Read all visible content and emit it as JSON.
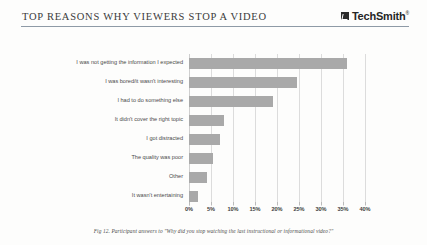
{
  "header": {
    "title": "TOP REASONS WHY VIEWERS STOP A VIDEO",
    "brand_name": "TechSmith",
    "brand_tm": "®",
    "brand_mark_icon": "techsmith-logo-icon"
  },
  "caption": "Fig 12. Participant answers to \"Why did you stop watching the last instructional or informational video?\"",
  "colors": {
    "bar": "#a9a9a9",
    "grid": "#dcdcdc",
    "rule": "#8e9aa6",
    "text": "#4a4a4a",
    "background": "#fdfdfc"
  },
  "chart_data": {
    "type": "bar",
    "orientation": "horizontal",
    "title": "TOP REASONS WHY VIEWERS STOP A VIDEO",
    "xlabel": "",
    "ylabel": "",
    "xlim": [
      0,
      40
    ],
    "grid": true,
    "legend": false,
    "tick_labels": [
      "0%",
      "5%",
      "10%",
      "15%",
      "20%",
      "25%",
      "30%",
      "35%",
      "40%"
    ],
    "tick_values": [
      0,
      5,
      10,
      15,
      20,
      25,
      30,
      35,
      40
    ],
    "categories": [
      "I was not getting the information I expected",
      "I was bored/it wasn't interesting",
      "I had to do something else",
      "It didn't cover the right topic",
      "I got distracted",
      "The quality was poor",
      "Other",
      "It wasn't entertaining"
    ],
    "values": [
      36,
      24.5,
      19,
      8,
      7,
      5.5,
      4,
      2
    ]
  }
}
